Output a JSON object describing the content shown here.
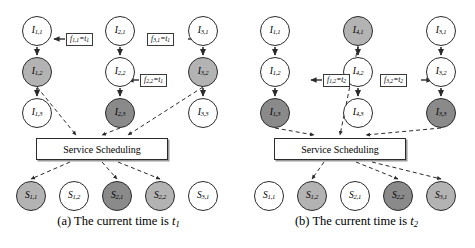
{
  "figure": {
    "type": "diagram"
  },
  "panels": [
    {
      "id": "a",
      "caption_prefix": "(a)",
      "caption_text": "The current time is",
      "caption_var": "t",
      "caption_sub": "1",
      "scheduler_label": "Service Scheduling",
      "instance_nodes": [
        {
          "name": "I",
          "sub": "1,1",
          "shade": "white",
          "col": 0,
          "row": 0
        },
        {
          "name": "I",
          "sub": "1,2",
          "shade": "gray",
          "col": 0,
          "row": 1
        },
        {
          "name": "I",
          "sub": "1,3",
          "shade": "white",
          "col": 0,
          "row": 2
        },
        {
          "name": "I",
          "sub": "2,1",
          "shade": "white",
          "col": 1,
          "row": 0
        },
        {
          "name": "I",
          "sub": "2,2",
          "shade": "white",
          "col": 1,
          "row": 1
        },
        {
          "name": "I",
          "sub": "2,3",
          "shade": "dark",
          "col": 1,
          "row": 2
        },
        {
          "name": "I",
          "sub": "3,1",
          "shade": "white",
          "col": 2,
          "row": 0
        },
        {
          "name": "I",
          "sub": "3,2",
          "shade": "gray",
          "col": 2,
          "row": 1
        },
        {
          "name": "I",
          "sub": "3,3",
          "shade": "white",
          "col": 2,
          "row": 2
        }
      ],
      "service_nodes": [
        {
          "name": "S",
          "sub": "1,1",
          "shade": "gray"
        },
        {
          "name": "S",
          "sub": "1,2",
          "shade": "white"
        },
        {
          "name": "S",
          "sub": "2,1",
          "shade": "dark"
        },
        {
          "name": "S",
          "sub": "2,2",
          "shade": "gray"
        },
        {
          "name": "S",
          "sub": "3,1",
          "shade": "white"
        }
      ],
      "flow_labels": [
        {
          "f": "f",
          "fsub": "1,1",
          "eq": "=",
          "t": "t",
          "tsub": "1",
          "x": 66,
          "y": 33,
          "dir": "left"
        },
        {
          "f": "f",
          "fsub": "3,1",
          "eq": "=",
          "t": "t",
          "tsub": "1",
          "x": 147,
          "y": 33,
          "dir": "right"
        },
        {
          "f": "f",
          "fsub": "2,2",
          "eq": "=",
          "t": "t",
          "tsub": "1",
          "x": 140,
          "y": 74,
          "dir": "left"
        }
      ]
    },
    {
      "id": "b",
      "caption_prefix": "(b)",
      "caption_text": "The current time is",
      "caption_var": "t",
      "caption_sub": "2",
      "scheduler_label": "Service Scheduling",
      "instance_nodes": [
        {
          "name": "I",
          "sub": "1,1",
          "shade": "white",
          "col": 0,
          "row": 0
        },
        {
          "name": "I",
          "sub": "1,2",
          "shade": "white",
          "col": 0,
          "row": 1
        },
        {
          "name": "I",
          "sub": "1,3",
          "shade": "dark",
          "col": 0,
          "row": 2
        },
        {
          "name": "I",
          "sub": "4,1",
          "shade": "gray",
          "col": 1,
          "row": 0
        },
        {
          "name": "I",
          "sub": "4,2",
          "shade": "white",
          "col": 1,
          "row": 1
        },
        {
          "name": "I",
          "sub": "4,3",
          "shade": "white",
          "col": 1,
          "row": 2
        },
        {
          "name": "I",
          "sub": "3,1",
          "shade": "white",
          "col": 2,
          "row": 0
        },
        {
          "name": "I",
          "sub": "3,2",
          "shade": "white",
          "col": 2,
          "row": 1
        },
        {
          "name": "I",
          "sub": "3,3",
          "shade": "dark",
          "col": 2,
          "row": 2
        }
      ],
      "service_nodes": [
        {
          "name": "S",
          "sub": "1,1",
          "shade": "white"
        },
        {
          "name": "S",
          "sub": "1,2",
          "shade": "gray"
        },
        {
          "name": "S",
          "sub": "2,1",
          "shade": "white"
        },
        {
          "name": "S",
          "sub": "2,2",
          "shade": "dark"
        },
        {
          "name": "S",
          "sub": "3,1",
          "shade": "gray"
        }
      ],
      "flow_labels": [
        {
          "f": "f",
          "fsub": "1,2",
          "eq": "=",
          "t": "t",
          "tsub": "2",
          "x": 85,
          "y": 74,
          "dir": "left"
        },
        {
          "f": "f",
          "fsub": "3,2",
          "eq": "=",
          "t": "t",
          "tsub": "2",
          "x": 142,
          "y": 74,
          "dir": "right"
        }
      ]
    }
  ],
  "colors": {
    "stroke": "#2b2b2b",
    "node_white": "#ffffff",
    "node_gray": "#b3b3b3",
    "node_dark": "#8a8a8a",
    "background": "#ffffff"
  }
}
